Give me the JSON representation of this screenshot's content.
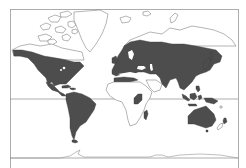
{
  "map": {
    "type": "world distribution map",
    "projection": "Mercator-like",
    "legend": null,
    "colors": {
      "background": "#ffffff",
      "land_outline": "#777777",
      "distribution_fill": "#4d4d4d",
      "frame": "#9a9a9a"
    },
    "features": {
      "frame": "rectangular border",
      "equator_line": true
    },
    "shaded_regions": [
      "North America (Alaska, Canada south of Arctic, USA, Mexico, Central America)",
      "Caribbean (Greater Antilles)",
      "South America",
      "Europe",
      "Northern Africa (Mediterranean coast)",
      "Asia (Siberia, Central Asia, Middle East, India, China, Japan, Southeast Asia)",
      "East Africa (Great Lakes region)",
      "Madagascar",
      "Indonesia, Philippines, New Guinea",
      "Australia",
      "New Zealand (North Island)"
    ],
    "unshaded_regions": [
      "Arctic Canadian archipelago",
      "Greenland",
      "Iceland",
      "Most of Africa",
      "Arabian Peninsula",
      "Arctic Russia coast",
      "Antarctica"
    ]
  }
}
